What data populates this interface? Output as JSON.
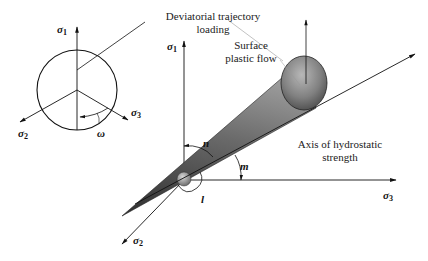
{
  "labels": {
    "deviatorial": [
      "Deviatorial trajectory",
      "loading"
    ],
    "surface": [
      "Surface",
      "plastic flow"
    ],
    "axis": [
      "Axis of hydrostatic",
      "strength"
    ]
  },
  "inset": {
    "sigma1": "σ",
    "sigma1_sub": "1",
    "sigma2": "σ",
    "sigma2_sub": "2",
    "sigma3": "σ",
    "sigma3_sub": "3",
    "omega": "ω"
  },
  "main_axes": {
    "sigma1": "σ",
    "sigma1_sub": "1",
    "sigma2": "σ",
    "sigma2_sub": "2",
    "sigma3": "σ",
    "sigma3_sub": "3"
  },
  "angles": {
    "n": "n",
    "m": "m",
    "l": "l"
  },
  "colors": {
    "cone_dark": "#3a3a3a",
    "cone_light": "#9a9a9a",
    "line": "#111111"
  }
}
